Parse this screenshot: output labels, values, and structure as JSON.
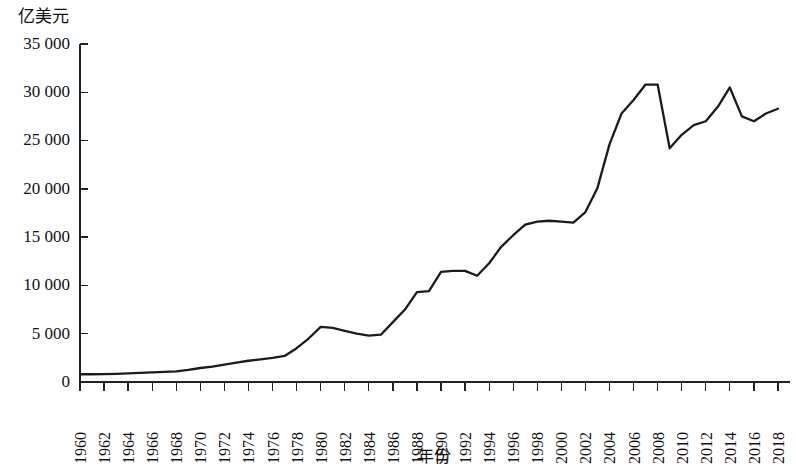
{
  "chart_data": {
    "type": "line",
    "title": "",
    "ylabel": "亿美元",
    "xlabel": "年份",
    "grid": false,
    "legend": "none",
    "ylim": [
      0,
      35000
    ],
    "yticks": [
      0,
      5000,
      10000,
      15000,
      20000,
      25000,
      30000,
      35000
    ],
    "ytick_labels": [
      "0",
      "5 000",
      "10 000",
      "15 000",
      "20 000",
      "25 000",
      "30 000",
      "35 000"
    ],
    "xlim": [
      1960,
      2019
    ],
    "xticks": [
      1960,
      1962,
      1964,
      1966,
      1968,
      1970,
      1972,
      1974,
      1976,
      1978,
      1980,
      1982,
      1984,
      1986,
      1988,
      1990,
      1992,
      1994,
      1996,
      1998,
      2000,
      2002,
      2004,
      2006,
      2008,
      2010,
      2012,
      2014,
      2016,
      2018
    ],
    "xtick_labels": [
      "1960",
      "1962",
      "1964",
      "1966",
      "1968",
      "1970",
      "1972",
      "1974",
      "1976",
      "1978",
      "1980",
      "1982",
      "1984",
      "1986",
      "1988",
      "1990",
      "1992",
      "1994",
      "1996",
      "1998",
      "2000",
      "2002",
      "2004",
      "2006",
      "2008",
      "2010",
      "2012",
      "2014",
      "2016",
      "2018"
    ],
    "x": [
      1960,
      1961,
      1962,
      1963,
      1964,
      1965,
      1966,
      1967,
      1968,
      1969,
      1970,
      1971,
      1972,
      1973,
      1974,
      1975,
      1976,
      1977,
      1978,
      1979,
      1980,
      1981,
      1982,
      1983,
      1984,
      1985,
      1986,
      1987,
      1988,
      1989,
      1990,
      1991,
      1992,
      1993,
      1994,
      1995,
      1996,
      1997,
      1998,
      1999,
      2000,
      2001,
      2002,
      2003,
      2004,
      2005,
      2006,
      2007,
      2008,
      2009,
      2010,
      2011,
      2012,
      2013,
      2014,
      2015,
      2016,
      2017,
      2018
    ],
    "values": [
      800,
      800,
      820,
      850,
      900,
      950,
      1000,
      1050,
      1100,
      1250,
      1450,
      1600,
      1800,
      2000,
      2200,
      2350,
      2500,
      2700,
      3500,
      4500,
      5700,
      5600,
      5300,
      5000,
      4800,
      4900,
      6200,
      7500,
      9300,
      9400,
      11400,
      11500,
      11500,
      11000,
      12300,
      14000,
      15200,
      16300,
      16600,
      16700,
      16600,
      16500,
      17600,
      20100,
      24600,
      27800,
      29200,
      30800,
      30800,
      24200,
      25600,
      26600,
      27000,
      28500,
      30500,
      27500,
      27000,
      27800,
      28300
    ],
    "series_name": "年度数值"
  }
}
